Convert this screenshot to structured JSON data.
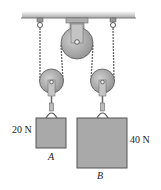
{
  "diagram": {
    "type": "pulley-system",
    "blocks": [
      {
        "id": "A",
        "label": "A",
        "weight": "20 N"
      },
      {
        "id": "B",
        "label": "B",
        "weight": "40 N"
      }
    ],
    "pulleys": [
      "fixed-top-pulley",
      "movable-left-pulley",
      "movable-right-pulley"
    ],
    "colors": {
      "metal": "#9a9a9a",
      "block": "#a8a8a8",
      "ceiling": "#b5b5b5",
      "outline": "#555555"
    }
  }
}
